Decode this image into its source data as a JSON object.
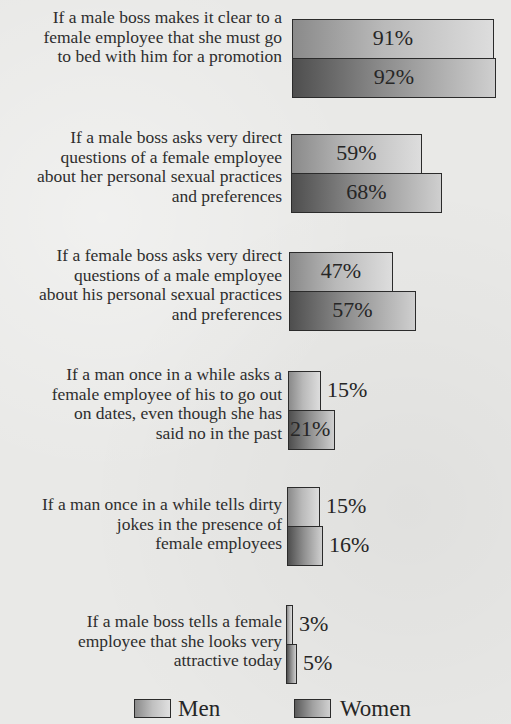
{
  "chart_data": {
    "type": "bar",
    "orientation": "horizontal",
    "title": "",
    "xlabel": "",
    "ylabel": "",
    "xlim": [
      0,
      100
    ],
    "grid": false,
    "legend_position": "bottom",
    "categories": [
      "If a male boss makes it clear to a female employee that she must go to bed with him for a promotion",
      "If a male boss asks very direct questions of a female employee about her personal sexual practices and preferences",
      "If a female boss asks very direct questions of a male employee about his personal sexual practices and preferences",
      "If a man once in a while asks a female employee of his to go out on dates, even though she has said no in the past",
      "If a man once in a while tells dirty jokes in the presence of female employees",
      "If a male boss tells a female employee that she looks very attractive today"
    ],
    "series": [
      {
        "name": "Men",
        "values": [
          91,
          59,
          47,
          15,
          15,
          3
        ]
      },
      {
        "name": "Women",
        "values": [
          92,
          68,
          57,
          21,
          16,
          5
        ]
      }
    ],
    "value_labels": [
      [
        "91%",
        "92%"
      ],
      [
        "59%",
        "68%"
      ],
      [
        "47%",
        "57%"
      ],
      [
        "15%",
        "21%"
      ],
      [
        "15%",
        "16%"
      ],
      [
        "3%",
        "5%"
      ]
    ]
  },
  "groups": [
    {
      "label_lines": [
        "If a male boss makes it clear to a",
        "female employee that she must go",
        "to bed with him for a promotion"
      ],
      "men": {
        "value": 91,
        "label": "91%"
      },
      "women": {
        "value": 92,
        "label": "92%"
      }
    },
    {
      "label_lines": [
        "If a male boss asks very direct",
        "questions of a female employee",
        "about her personal sexual practices",
        "and preferences"
      ],
      "men": {
        "value": 59,
        "label": "59%"
      },
      "women": {
        "value": 68,
        "label": "68%"
      }
    },
    {
      "label_lines": [
        "If a female boss asks very direct",
        "questions of a male employee",
        "about his personal sexual practices",
        "and preferences"
      ],
      "men": {
        "value": 47,
        "label": "47%"
      },
      "women": {
        "value": 57,
        "label": "57%"
      }
    },
    {
      "label_lines": [
        "If a man once in a while asks a",
        "female employee of his to go out",
        "on dates, even though she has",
        "said no in the past"
      ],
      "men": {
        "value": 15,
        "label": "15%"
      },
      "women": {
        "value": 21,
        "label": "21%"
      }
    },
    {
      "label_lines": [
        "If a man once in a while tells dirty",
        "jokes in the presence of",
        "female employees"
      ],
      "men": {
        "value": 15,
        "label": "15%"
      },
      "women": {
        "value": 16,
        "label": "16%"
      }
    },
    {
      "label_lines": [
        "If a male boss tells a female",
        "employee that she looks very",
        "attractive today"
      ],
      "men": {
        "value": 3,
        "label": "3%"
      },
      "women": {
        "value": 5,
        "label": "5%"
      }
    }
  ],
  "legend": {
    "men_label": "Men",
    "women_label": "Women"
  },
  "colors": {
    "men_bar": "#c0c0c0",
    "women_bar": "#8d8d8d",
    "border": "#2b2b2b",
    "background": "#e9e9e7"
  }
}
